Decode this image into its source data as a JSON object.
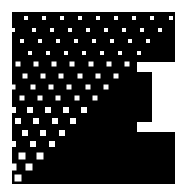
{
  "graphic": {
    "description": "Black notched block shape with white halftone square-dot gradient",
    "background_color": "#ffffff",
    "shape_color": "#000000",
    "dot_color": "#ffffff",
    "shape_polygon": [
      [
        12,
        12
      ],
      [
        175,
        12
      ],
      [
        175,
        62
      ],
      [
        137,
        62
      ],
      [
        137,
        72
      ],
      [
        152,
        72
      ],
      [
        152,
        122
      ],
      [
        137,
        122
      ],
      [
        137,
        132
      ],
      [
        175,
        132
      ],
      [
        175,
        184
      ],
      [
        12,
        184
      ]
    ],
    "dot_rows": [
      {
        "y": 18,
        "size": 4,
        "xs": [
          26,
          44,
          62,
          80,
          98,
          116,
          134,
          152,
          171
        ]
      },
      {
        "y": 30,
        "size": 4,
        "xs": [
          13,
          34,
          52,
          70,
          88,
          106,
          124,
          142,
          160
        ]
      },
      {
        "y": 41,
        "size": 4,
        "xs": [
          22,
          40,
          58,
          76,
          94,
          112,
          130,
          148
        ]
      },
      {
        "y": 53,
        "size": 4,
        "xs": [
          30,
          48,
          66,
          84,
          102,
          120,
          139
        ]
      },
      {
        "y": 64,
        "size": 5,
        "xs": [
          18,
          36,
          54,
          72,
          91,
          109,
          127
        ]
      },
      {
        "y": 76,
        "size": 5,
        "xs": [
          25,
          43,
          61,
          80,
          98,
          116
        ]
      },
      {
        "y": 87,
        "size": 5,
        "xs": [
          13,
          33,
          51,
          69,
          88,
          106
        ]
      },
      {
        "y": 98,
        "size": 5,
        "xs": [
          22,
          40,
          58,
          77,
          95
        ]
      },
      {
        "y": 110,
        "size": 6,
        "xs": [
          13,
          30,
          48,
          66,
          84
        ]
      },
      {
        "y": 121,
        "size": 6,
        "xs": [
          18,
          36,
          55,
          73
        ]
      },
      {
        "y": 133,
        "size": 6,
        "xs": [
          25,
          43,
          62
        ]
      },
      {
        "y": 144,
        "size": 6,
        "xs": [
          13,
          33,
          52
        ]
      },
      {
        "y": 156,
        "size": 7,
        "xs": [
          22,
          40
        ]
      },
      {
        "y": 167,
        "size": 7,
        "xs": [
          13,
          29
        ]
      },
      {
        "y": 178,
        "size": 7,
        "xs": [
          18
        ]
      }
    ]
  }
}
